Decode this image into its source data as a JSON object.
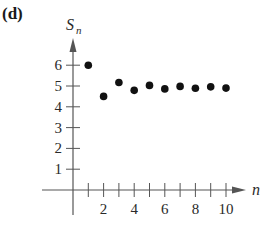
{
  "panel_label": "(d)",
  "chart_data": {
    "type": "scatter",
    "title": "",
    "xlabel": "n",
    "ylabel": "S_n",
    "ylabel_main": "S",
    "ylabel_sub": "n",
    "x": [
      1,
      2,
      3,
      4,
      5,
      6,
      7,
      8,
      9,
      10
    ],
    "values": [
      6.0,
      4.5,
      5.17,
      4.79,
      5.03,
      4.86,
      4.98,
      4.89,
      4.96,
      4.9
    ],
    "xlim": [
      0,
      11
    ],
    "ylim": [
      0,
      7
    ],
    "x_ticks": [
      1,
      2,
      3,
      4,
      5,
      6,
      7,
      8,
      9,
      10
    ],
    "x_tick_labels": [
      "2",
      "4",
      "6",
      "8",
      "10"
    ],
    "y_ticks": [
      1,
      2,
      3,
      4,
      5,
      6
    ],
    "y_tick_labels": [
      "1",
      "2",
      "3",
      "4",
      "5",
      "6"
    ],
    "grid": false,
    "legend": null,
    "point_color": "#111111"
  }
}
